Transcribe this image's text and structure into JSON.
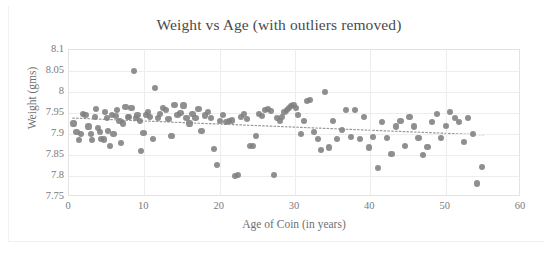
{
  "chart_data": {
    "type": "scatter",
    "title": "Weight vs Age (with outliers removed)",
    "xlabel": "Age of Coin (in years)",
    "ylabel": "Weight (gms)",
    "xlim": [
      0,
      60
    ],
    "ylim": [
      7.75,
      8.1
    ],
    "xticks": [
      0,
      10,
      20,
      30,
      40,
      50,
      60
    ],
    "xtick_labels": [
      "0",
      "10",
      "20",
      "30",
      "40",
      "50",
      "60"
    ],
    "yticks": [
      7.75,
      7.8,
      7.85,
      7.9,
      7.95,
      8,
      8.05,
      8.1
    ],
    "ytick_labels": [
      "7.75",
      "7.8",
      "7.85",
      "7.9",
      "7.95",
      "8",
      "8.05",
      "8.1"
    ],
    "grid": true,
    "legend": false,
    "marker_color": "#808080",
    "marker_shape": "circle",
    "series": [
      {
        "name": "Coins",
        "x": [
          0.6,
          1.0,
          1.3,
          1.6,
          1.9,
          2.2,
          2.6,
          2.9,
          3.1,
          3.4,
          3.6,
          3.9,
          4.1,
          4.3,
          4.6,
          4.8,
          5.0,
          5.2,
          5.4,
          5.7,
          5.9,
          6.2,
          6.4,
          6.7,
          6.9,
          7.2,
          7.5,
          7.8,
          8.0,
          8.3,
          8.6,
          8.9,
          9.1,
          9.4,
          9.6,
          9.9,
          10.2,
          10.5,
          10.8,
          11.1,
          11.4,
          11.8,
          12.1,
          12.5,
          12.9,
          13.2,
          13.6,
          14.0,
          14.4,
          14.8,
          15.2,
          15.6,
          16.0,
          16.4,
          16.8,
          17.2,
          17.6,
          18.0,
          18.4,
          18.8,
          19.2,
          19.6,
          20.0,
          20.4,
          20.8,
          21.2,
          21.6,
          22.0,
          22.4,
          22.8,
          23.2,
          23.6,
          24.0,
          24.4,
          24.8,
          25.2,
          25.6,
          26.0,
          26.4,
          26.8,
          27.2,
          27.6,
          28.0,
          28.3,
          28.6,
          28.9,
          29.2,
          29.5,
          29.8,
          30.1,
          30.4,
          30.8,
          31.2,
          31.6,
          32.0,
          32.5,
          33.0,
          33.5,
          34.0,
          34.5,
          35.0,
          35.6,
          36.2,
          36.8,
          37.4,
          38.0,
          38.6,
          39.2,
          39.8,
          40.4,
          41.0,
          41.6,
          42.2,
          42.8,
          43.4,
          44.0,
          44.6,
          45.2,
          45.8,
          46.4,
          47.0,
          47.6,
          48.2,
          48.8,
          49.4,
          50.0,
          50.6,
          51.2,
          51.8,
          52.4,
          53.0,
          53.6,
          54.2,
          54.8
        ],
        "y": [
          7.925,
          7.905,
          7.885,
          7.9,
          7.948,
          7.945,
          7.918,
          7.9,
          7.886,
          7.94,
          7.96,
          7.915,
          7.905,
          7.888,
          7.887,
          7.952,
          7.938,
          7.908,
          7.872,
          7.945,
          7.9,
          7.942,
          7.958,
          7.93,
          7.878,
          7.925,
          7.965,
          7.941,
          7.94,
          7.962,
          8.05,
          7.938,
          7.945,
          7.93,
          7.86,
          7.902,
          7.945,
          7.952,
          7.94,
          7.888,
          8.01,
          7.938,
          7.948,
          7.962,
          7.958,
          7.935,
          7.895,
          7.97,
          7.945,
          7.95,
          7.968,
          7.938,
          7.925,
          7.948,
          7.938,
          7.96,
          7.908,
          7.944,
          7.952,
          7.938,
          7.865,
          7.826,
          7.93,
          7.945,
          7.928,
          7.93,
          7.932,
          7.8,
          7.802,
          7.94,
          7.948,
          7.935,
          7.872,
          7.872,
          7.895,
          7.948,
          7.942,
          7.958,
          7.96,
          7.955,
          7.802,
          7.938,
          7.93,
          7.94,
          7.952,
          7.958,
          7.962,
          7.966,
          7.97,
          7.962,
          7.945,
          7.9,
          7.93,
          7.978,
          7.98,
          7.905,
          7.888,
          7.862,
          8.0,
          7.868,
          7.93,
          7.888,
          7.91,
          7.958,
          7.892,
          7.958,
          7.888,
          7.94,
          7.868,
          7.892,
          7.82,
          7.928,
          7.89,
          7.852,
          7.918,
          7.93,
          7.872,
          7.94,
          7.918,
          7.89,
          7.85,
          7.87,
          7.928,
          7.948,
          7.89,
          7.92,
          7.952,
          7.938,
          7.928,
          7.88,
          7.938,
          7.9,
          7.782,
          7.822
        ]
      }
    ],
    "trendline": {
      "type": "linear-dotted",
      "x_start": 0.5,
      "y_start": 7.938,
      "x_end": 55.0,
      "y_end": 7.898,
      "color": "#999999"
    }
  }
}
